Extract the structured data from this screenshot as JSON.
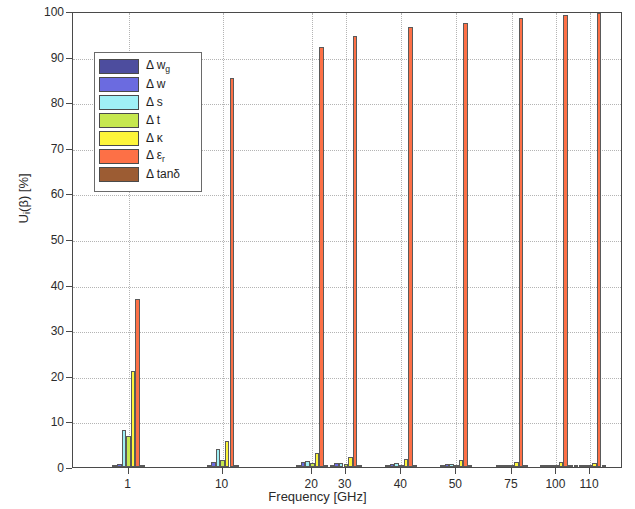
{
  "chart_data": {
    "type": "bar",
    "title": "",
    "xlabel": "Frequency [GHz]",
    "ylabel": "U_i(β) [%]",
    "ylabel_parts": {
      "main": "U",
      "sub": "i",
      "rest": "(β) [%]"
    },
    "categories": [
      "1",
      "10",
      "20",
      "30",
      "40",
      "50",
      "75",
      "100",
      "110"
    ],
    "xtick_labels": [
      "1",
      "10",
      "20",
      "30",
      "40",
      "50",
      "75",
      "100",
      "110"
    ],
    "ytick_labels": [
      "0",
      "10",
      "20",
      "30",
      "40",
      "50",
      "60",
      "70",
      "80",
      "90",
      "100"
    ],
    "ylim": [
      0,
      100
    ],
    "ytick_step": 10,
    "grid": "dotted",
    "legend_position": "upper-left",
    "series": [
      {
        "name": "Δ w₉",
        "label_main": "Δ w",
        "label_sub": "g",
        "color": "#4d4d9e",
        "values": [
          0.4,
          0.3,
          0.3,
          0.3,
          0.3,
          0.2,
          0.2,
          0.2,
          0.2
        ]
      },
      {
        "name": "Δ w",
        "label_main": "Δ w",
        "label_sub": "",
        "color": "#6b6be0",
        "values": [
          0.6,
          1.2,
          1.0,
          0.8,
          0.7,
          0.6,
          0.5,
          0.5,
          0.4
        ]
      },
      {
        "name": "Δ s",
        "label_main": "Δ s",
        "label_sub": "",
        "color": "#9ff0f5",
        "values": [
          8.2,
          4.0,
          1.3,
          0.9,
          0.8,
          0.6,
          0.5,
          0.4,
          0.4
        ]
      },
      {
        "name": "Δ t",
        "label_main": "Δ t",
        "label_sub": "",
        "color": "#c6e84f",
        "values": [
          6.8,
          1.6,
          0.8,
          0.6,
          0.5,
          0.4,
          0.4,
          0.3,
          0.3
        ]
      },
      {
        "name": "Δ κ",
        "label_main": "Δ κ",
        "label_sub": "",
        "color": "#fdf53a",
        "values": [
          21.0,
          5.6,
          3.0,
          2.2,
          1.8,
          1.5,
          1.1,
          1.0,
          0.9
        ]
      },
      {
        "name": "Δ εᵣ",
        "label_main": "Δ ε",
        "label_sub": "r",
        "color": "#fd7046",
        "values": [
          36.8,
          85.4,
          92.0,
          94.6,
          96.4,
          97.4,
          98.5,
          99.1,
          99.6
        ]
      },
      {
        "name": "Δ tanδ",
        "label_main": "Δ tanδ",
        "label_sub": "",
        "color": "#9c5c33",
        "values": [
          0.3,
          0.3,
          0.3,
          0.3,
          0.3,
          0.3,
          0.3,
          0.3,
          0.3
        ]
      }
    ],
    "group_centers_px": [
      128,
      221,
      311,
      344,
      400,
      455,
      511,
      555,
      589
    ],
    "group_center_fractions": [
      0.101,
      0.272,
      0.435,
      0.496,
      0.597,
      0.697,
      0.798,
      0.879,
      0.94
    ]
  }
}
